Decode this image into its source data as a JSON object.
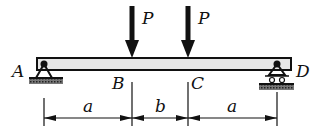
{
  "diagram": {
    "type": "simply-supported-beam",
    "points": {
      "A": "A",
      "B": "B",
      "C": "C",
      "D": "D"
    },
    "loads": [
      {
        "label": "P",
        "at": "B",
        "direction": "down"
      },
      {
        "label": "P",
        "at": "C",
        "direction": "down"
      }
    ],
    "supports": [
      {
        "at": "A",
        "kind": "pin"
      },
      {
        "at": "D",
        "kind": "roller"
      }
    ],
    "dimensions": [
      {
        "label": "a",
        "from": "A",
        "to": "B"
      },
      {
        "label": "b",
        "from": "B",
        "to": "C"
      },
      {
        "label": "a",
        "from": "C",
        "to": "D"
      }
    ],
    "colors": {
      "ink": "#111111",
      "beam_fill": "#e6e6e6",
      "background": "#ffffff"
    }
  }
}
